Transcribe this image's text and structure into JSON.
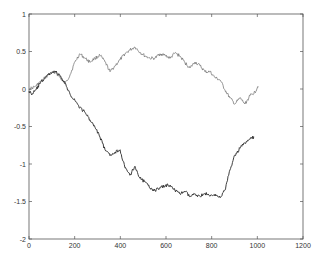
{
  "chart_data": {
    "type": "line",
    "title": "",
    "xlabel": "",
    "ylabel": "",
    "xlim": [
      0,
      1200
    ],
    "ylim": [
      -2,
      1
    ],
    "xticks": [
      0,
      200,
      400,
      600,
      800,
      1000,
      1200
    ],
    "yticks": [
      1,
      0.5,
      0,
      -0.5,
      -1,
      -1.5,
      -2
    ],
    "xtick_labels": [
      "0",
      "200",
      "400",
      "600",
      "800",
      "1000",
      "1200"
    ],
    "ytick_labels": [
      "1",
      "0.5",
      "0",
      "-0.5",
      "-1",
      "-1.5",
      "-2"
    ],
    "grid": false,
    "legend": null,
    "box": true,
    "series": [
      {
        "name": "random walk 1 (upper)",
        "color": "#6a6a6a",
        "x": [
          0,
          26,
          48,
          70,
          92,
          114,
          136,
          158,
          180,
          201,
          223,
          245,
          267,
          289,
          311,
          333,
          355,
          377,
          399,
          420,
          442,
          464,
          486,
          508,
          530,
          552,
          574,
          596,
          618,
          639,
          661,
          683,
          705,
          727,
          749,
          771,
          793,
          815,
          837,
          858,
          880,
          902,
          924,
          946,
          968,
          990,
          1003
        ],
        "y": [
          0.0,
          0.03,
          0.09,
          0.15,
          0.2,
          0.23,
          0.15,
          0.07,
          0.19,
          0.36,
          0.47,
          0.41,
          0.36,
          0.41,
          0.45,
          0.36,
          0.23,
          0.31,
          0.39,
          0.47,
          0.52,
          0.56,
          0.49,
          0.44,
          0.41,
          0.41,
          0.47,
          0.45,
          0.41,
          0.48,
          0.44,
          0.35,
          0.28,
          0.36,
          0.31,
          0.23,
          0.23,
          0.15,
          0.12,
          -0.01,
          -0.12,
          -0.2,
          -0.12,
          -0.2,
          -0.09,
          -0.04,
          0.04
        ]
      },
      {
        "name": "random walk 2 (lower)",
        "color": "#2a2a2a",
        "x": [
          0,
          13,
          31,
          48,
          70,
          92,
          114,
          136,
          158,
          180,
          201,
          223,
          245,
          267,
          289,
          311,
          333,
          355,
          377,
          399,
          420,
          442,
          464,
          486,
          508,
          530,
          552,
          574,
          596,
          618,
          639,
          661,
          683,
          705,
          727,
          749,
          771,
          793,
          815,
          837,
          858,
          880,
          902,
          924,
          946,
          968,
          986
        ],
        "y": [
          -0.03,
          -0.07,
          -0.01,
          0.07,
          0.15,
          0.21,
          0.24,
          0.17,
          0.07,
          -0.07,
          -0.15,
          -0.25,
          -0.31,
          -0.41,
          -0.51,
          -0.64,
          -0.81,
          -0.89,
          -0.84,
          -0.81,
          -1.05,
          -1.15,
          -1.03,
          -1.19,
          -1.24,
          -1.32,
          -1.35,
          -1.32,
          -1.29,
          -1.28,
          -1.35,
          -1.4,
          -1.36,
          -1.44,
          -1.4,
          -1.43,
          -1.39,
          -1.43,
          -1.4,
          -1.45,
          -1.35,
          -1.08,
          -0.88,
          -0.79,
          -0.72,
          -0.67,
          -0.64
        ]
      }
    ]
  },
  "layout": {
    "plot_left_px": 29,
    "plot_top_px": 14,
    "plot_right_px": 303,
    "plot_bottom_px": 239
  }
}
